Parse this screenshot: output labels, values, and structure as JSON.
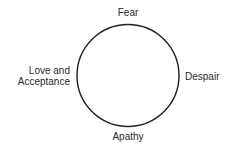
{
  "diagram": {
    "type": "cycle",
    "shape": "circle",
    "stroke_color": "#1e1e1e",
    "labels": {
      "top": "Fear",
      "right": "Despair",
      "bottom": "Apathy",
      "left_line1": "Love and",
      "left_line2": "Acceptance"
    }
  }
}
